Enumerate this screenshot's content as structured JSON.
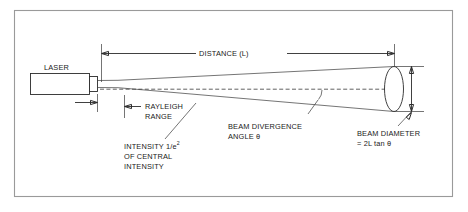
{
  "figure": {
    "type": "technical-line-diagram",
    "background_color": "#ffffff",
    "line_color": "#2b2b2b",
    "frame_color": "#9a9a9a",
    "text_color": "#1a1a1a"
  },
  "labels": {
    "laser": "LASER",
    "distance": "DISTANCE (L)",
    "rayleigh_line1": "RAYLEIGH",
    "rayleigh_line2": "RANGE",
    "intensity_line1_pre": "INTENSITY 1/e",
    "intensity_line1_sup": "2",
    "intensity_line2": "OF CENTRAL",
    "intensity_line3": "INTENSITY",
    "divergence_line1": "BEAM DIVERGENCE",
    "divergence_line2": "ANGLE θ",
    "diameter_line1": "BEAM DIAMETER",
    "diameter_line2": "= 2L tan θ"
  },
  "elements": {
    "laser_body_name": "laser-housing",
    "laser_aperture_name": "laser-output-aperture",
    "beam_cone_name": "diverging-beam-cone",
    "beam_axis_name": "beam-optical-axis",
    "beam_spot_name": "beam-cross-section-ellipse",
    "divergence_arc_name": "divergence-angle-arc"
  }
}
